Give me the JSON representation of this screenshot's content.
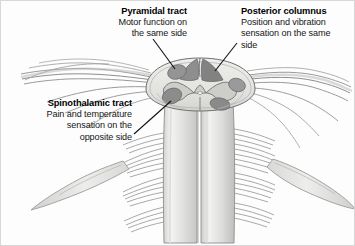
{
  "figure": {
    "background_color": "#fdfdfd",
    "border_color": "#d8d8d8",
    "width": 355,
    "height": 246
  },
  "callouts": [
    {
      "id": "pyramidal",
      "title": "Pyramidal tract",
      "description": "Motor function on the same side",
      "description_lines": [
        "Motor function on",
        "the same side"
      ],
      "align": "right",
      "leader_from": [
        152,
        38
      ],
      "leader_to": [
        176,
        70
      ],
      "target": "pyramidal-tract-oval"
    },
    {
      "id": "posterior",
      "title": "Posterior columnus",
      "description": "Position and vibration sensation on the same side",
      "description_lines": [
        "Position and vibration",
        "sensation on the same",
        "side"
      ],
      "align": "left",
      "leader_from": [
        236,
        42
      ],
      "leader_to": [
        213,
        70
      ],
      "target": "posterior-columns-wedge"
    },
    {
      "id": "spinothalamic",
      "title": "Spinothalamic tract",
      "description": "Pain and temperature sensation on the opposite side",
      "description_lines": [
        "Pain and temperature",
        "sensation on the",
        "opposite side"
      ],
      "align": "right",
      "leader_from": [
        133,
        133
      ],
      "leader_to": [
        172,
        100
      ],
      "target": "spinothalamic-tract-oval"
    }
  ],
  "anatomy": {
    "cross_section": {
      "name": "spinal-cord-cross-section",
      "center": [
        200,
        88
      ],
      "radius_x": 56,
      "radius_y": 32,
      "white_matter_color": "#e6e6e4",
      "outline_color": "#6f6f6f"
    },
    "gray_matter": {
      "name": "butterfly-gray-matter",
      "color": "#cfcfcb",
      "outline_color": "#707070"
    },
    "tracts": [
      {
        "name": "posterior-columns-wedge",
        "color": "#8d8d8d",
        "side": "posterior"
      },
      {
        "name": "pyramidal-tract-oval-left",
        "color": "#8f8f8f",
        "side": "antero-lateral-left"
      },
      {
        "name": "pyramidal-tract-oval-right",
        "color": "#8f8f8f",
        "side": "antero-lateral-right"
      },
      {
        "name": "spinothalamic-tract-oval-left",
        "color": "#8a8a8a",
        "side": "lateral-left"
      },
      {
        "name": "spinothalamic-tract-oval-right",
        "color": "#8a8a8a",
        "side": "lateral-right"
      }
    ],
    "cord_columns": {
      "name": "descending-cord-columns",
      "count": 2,
      "fill_start": "#f2f2f0",
      "fill_end": "#cfcfcd"
    },
    "nerve_roots": {
      "name": "spinal-nerve-rootlets",
      "left_bundles": 5,
      "right_bundles": 5,
      "strand_color": "#8a8a8a"
    }
  },
  "colors": {
    "ink": "#111111",
    "leader_line": "#111111",
    "tissue_light": "#eeeeec",
    "tissue_mid": "#cfcfcb",
    "tissue_dark": "#8d8d8d",
    "outline": "#6f6f6f"
  }
}
